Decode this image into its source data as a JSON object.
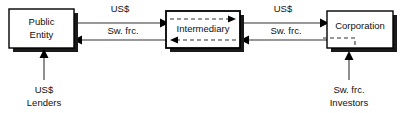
{
  "diagram": {
    "boxes": [
      {
        "id": "public-entity",
        "label_line1": "Public",
        "label_line2": "Entity",
        "x": 9,
        "y": 9,
        "w": 65,
        "h": 39
      },
      {
        "id": "intermediary",
        "label_line1": "Intermediary",
        "label_line2": "",
        "x": 166,
        "y": 11,
        "w": 74,
        "h": 37
      },
      {
        "id": "corporation",
        "label_line1": "Corporation",
        "label_line2": "",
        "x": 327,
        "y": 11,
        "w": 66,
        "h": 37
      }
    ],
    "flows": [
      {
        "id": "flow-left-top",
        "label": "US$",
        "direction": "right",
        "from": "public-entity",
        "to": "intermediary"
      },
      {
        "id": "flow-left-bottom",
        "label": "Sw. frc.",
        "direction": "left",
        "from": "intermediary",
        "to": "public-entity"
      },
      {
        "id": "flow-right-top",
        "label": "US$",
        "direction": "right",
        "from": "intermediary",
        "to": "corporation"
      },
      {
        "id": "flow-right-bottom",
        "label": "Sw. frc.",
        "direction": "left",
        "from": "corporation",
        "to": "intermediary"
      }
    ],
    "parties": [
      {
        "id": "lenders",
        "line1": "US$",
        "line2": "Lenders",
        "arrow_to": "public-entity"
      },
      {
        "id": "investors",
        "line1": "Sw. frc.",
        "line2": "Investors",
        "arrow_to": "corporation"
      }
    ],
    "colors": {
      "background": "#ffffff",
      "box_fill": "#ffffff",
      "box_stroke": "#000000",
      "box_shadow": "#1a1a1a",
      "line": "#333333",
      "text": "#111111"
    }
  }
}
